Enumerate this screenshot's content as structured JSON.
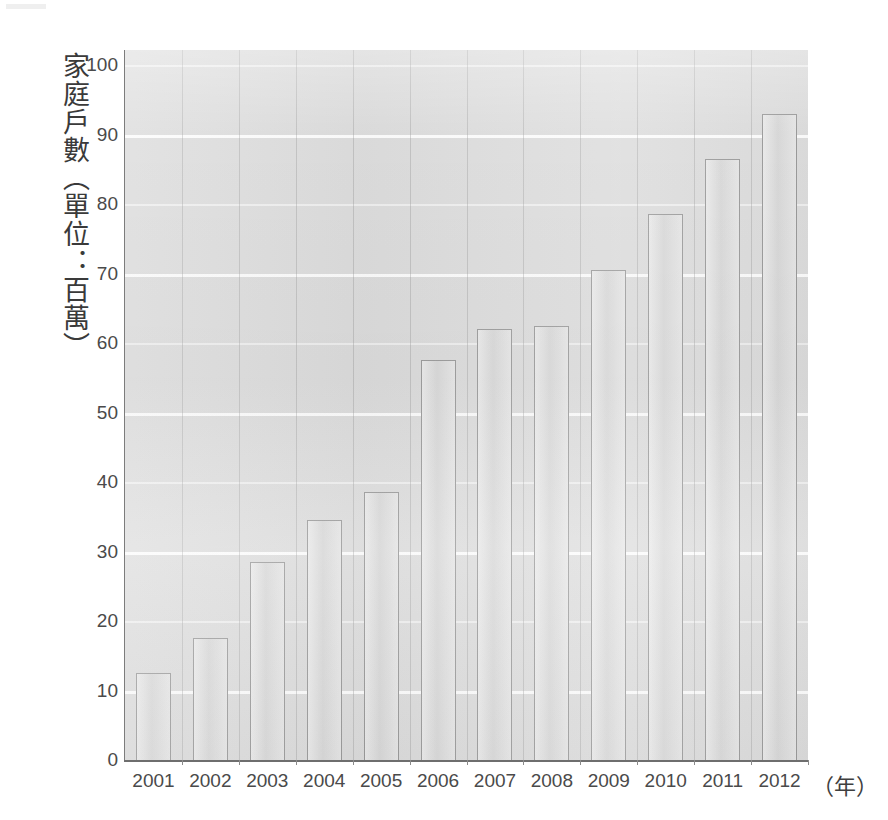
{
  "chart_data": {
    "type": "bar",
    "title": "",
    "xlabel": "（年）",
    "ylabel": "家庭戶數（單位：百萬）",
    "categories": [
      "2001",
      "2002",
      "2003",
      "2004",
      "2005",
      "2006",
      "2007",
      "2008",
      "2009",
      "2010",
      "2011",
      "2012"
    ],
    "values": [
      12.5,
      17.5,
      28.5,
      34.5,
      38.5,
      57.5,
      62,
      62.5,
      70.5,
      78.5,
      86.5,
      93
    ],
    "ylim": [
      0,
      100
    ],
    "ytick_labels": [
      "0",
      "10",
      "20",
      "30",
      "40",
      "50",
      "60",
      "70",
      "80",
      "90",
      "100"
    ],
    "ytick_values": [
      0,
      10,
      20,
      30,
      40,
      50,
      60,
      70,
      80,
      90,
      100
    ],
    "grid": true,
    "grid_orientation": "horizontal",
    "legend": false,
    "legend_position": "none",
    "bar_fill_color": "#dfdfdf",
    "bar_border_color": "#9a9a9a",
    "plot_background_color": "#dcdcdc",
    "gridline_color": "#fdfdfd",
    "axis_color": "#7c7c7c",
    "text_color": "#4a4a4a"
  },
  "figure": {
    "y_axis_title": "家庭戶數（單位：百萬）",
    "x_axis_unit": "（年）"
  }
}
